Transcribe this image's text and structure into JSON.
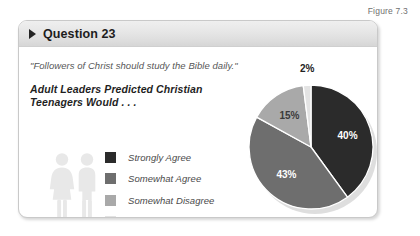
{
  "figure": {
    "label": "Figure 7.3"
  },
  "card": {
    "header": {
      "bullet_icon": "triangle-right-icon",
      "title": "Question 23"
    },
    "quote": "\"Followers of Christ should study the Bible daily.\"",
    "subtitle_line1": "Adult Leaders Predicted Christian",
    "subtitle_line2": "Teenagers Would . . .",
    "people_icon": "two-people-icon"
  },
  "legend": {
    "items": [
      {
        "label": "Strongly Agree",
        "color": "#2b2b2b"
      },
      {
        "label": "Somewhat Agree",
        "color": "#6e6e6e"
      },
      {
        "label": "Somewhat Disagree",
        "color": "#a9a9a9"
      },
      {
        "label": "Strongly Disagree",
        "color": "#e3e3e3"
      }
    ]
  },
  "chart_data": {
    "type": "pie",
    "title": "Adult Leaders Predicted Christian Teenagers Would . . .",
    "subtitle": "\"Followers of Christ should study the Bible daily.\"",
    "categories": [
      "Strongly Agree",
      "Somewhat Agree",
      "Somewhat Disagree",
      "Strongly Disagree"
    ],
    "values": [
      40,
      43,
      15,
      2
    ],
    "labels": [
      "40%",
      "43%",
      "15%",
      "2%"
    ],
    "colors": [
      "#2b2b2b",
      "#6e6e6e",
      "#a9a9a9",
      "#e3e3e3"
    ],
    "unit": "percent",
    "total": 100,
    "start_angle_deg": 0,
    "direction": "clockwise",
    "legend_position": "left",
    "grid": false
  }
}
